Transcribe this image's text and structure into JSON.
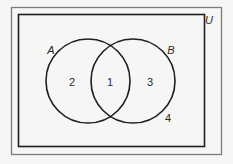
{
  "diagram": {
    "type": "venn",
    "universal_set": {
      "label": "U",
      "label_pos": {
        "x": 209,
        "y": 20
      }
    },
    "sets": [
      {
        "name": "A",
        "label": "A",
        "center": {
          "x": 88,
          "y": 81
        },
        "radius": 42,
        "label_pos": {
          "x": 51,
          "y": 50
        }
      },
      {
        "name": "B",
        "label": "B",
        "center": {
          "x": 133,
          "y": 81
        },
        "radius": 42,
        "label_pos": {
          "x": 171,
          "y": 50
        }
      }
    ],
    "regions": [
      {
        "id": "region-a-only",
        "label": "2",
        "description": "A only",
        "pos": {
          "x": 72,
          "y": 82
        }
      },
      {
        "id": "region-a-and-b",
        "label": "1",
        "description": "A ∩ B",
        "pos": {
          "x": 110,
          "y": 82
        }
      },
      {
        "id": "region-b-only",
        "label": "3",
        "description": "B only",
        "pos": {
          "x": 150,
          "y": 82
        }
      },
      {
        "id": "region-outside",
        "label": "4",
        "description": "Neither A nor B",
        "pos": {
          "x": 168,
          "y": 118
        }
      }
    ],
    "colors": {
      "background": "#f6f6f4",
      "outer_frame": "#7a7a7a",
      "inner_box": "#1e1e1e",
      "circle_stroke": "#1e1e1e",
      "text": "#2a2a2a"
    }
  }
}
